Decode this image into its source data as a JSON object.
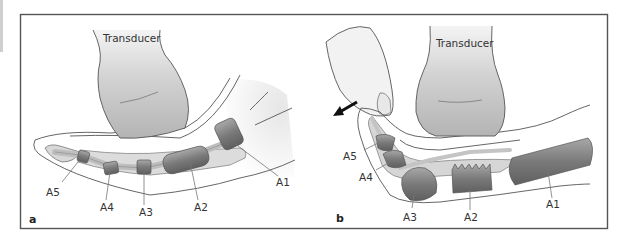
{
  "figure": {
    "panels": [
      {
        "id": "a",
        "label": "a",
        "transducer_label": "Transducer",
        "pulley_labels": [
          "A1",
          "A2",
          "A3",
          "A4",
          "A5"
        ],
        "state": "finger extended"
      },
      {
        "id": "b",
        "label": "b",
        "transducer_label": "Transducer",
        "pulley_labels": [
          "A1",
          "A2",
          "A3",
          "A4",
          "A5"
        ],
        "state": "finger flexed with thumb applying force",
        "arrow": "arrow pointing down-left indicating direction of force"
      }
    ],
    "colors": {
      "frame": "#555555",
      "pulley": "#7d7d7d",
      "tendon": "#c8c8c8",
      "soft_tissue": "#d9d9d9",
      "transducer": "#bdbdbd"
    }
  }
}
